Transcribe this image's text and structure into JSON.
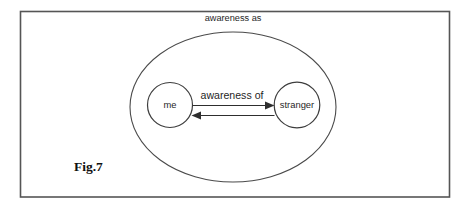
{
  "figure": {
    "caption": "Fig.7",
    "frame": {
      "border_color": "#555555",
      "background_color": "#ffffff"
    }
  },
  "outer_set": {
    "label": "awareness as",
    "stroke_color": "#4a4a4a",
    "shape": "ellipse"
  },
  "nodes": [
    {
      "id": "me",
      "label": "me",
      "shape": "circle",
      "stroke_color": "#3d3d3d"
    },
    {
      "id": "stranger",
      "label": "stranger",
      "shape": "circle",
      "stroke_color": "#3d3d3d"
    }
  ],
  "relation": {
    "label": "awareness of",
    "direction": "bidirectional",
    "stroke_color": "#2e2e2e",
    "arrows": [
      {
        "from": "me",
        "to": "stranger",
        "points": "right"
      },
      {
        "from": "stranger",
        "to": "me",
        "points": "left"
      }
    ]
  }
}
